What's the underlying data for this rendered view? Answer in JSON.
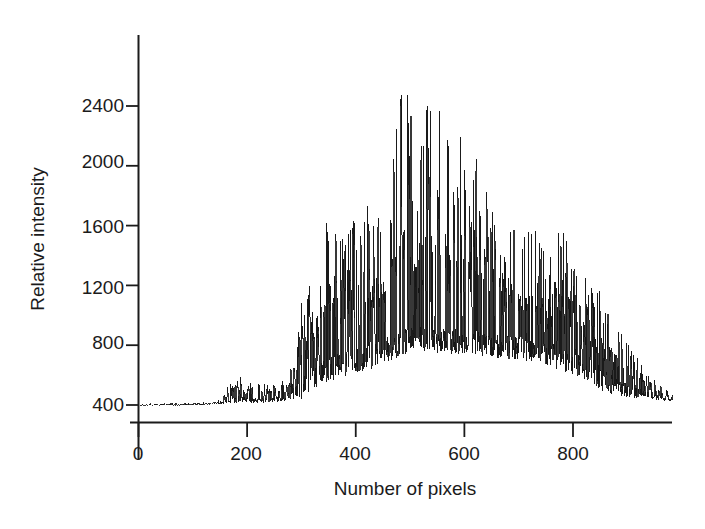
{
  "figure": {
    "background_color": "#ffffff",
    "trace_color": "#151515",
    "axis_color": "#1b1b1b"
  },
  "axes": {
    "x_title": "Number of pixels",
    "y_title": "Relative intensity",
    "x_ticks": [
      "0",
      "200",
      "400",
      "600",
      "800"
    ],
    "y_ticks": [
      "400",
      "800",
      "1200",
      "1600",
      "2000",
      "2400"
    ]
  },
  "chart_data": {
    "type": "line",
    "title": "",
    "subtitle": "",
    "xlabel": "Number of pixels",
    "ylabel": "Relative intensity",
    "xlim": [
      0,
      985
    ],
    "ylim": [
      330,
      2750
    ],
    "xticks": [
      0,
      200,
      400,
      600,
      800
    ],
    "yticks": [
      400,
      800,
      1200,
      1600,
      2000,
      2400
    ],
    "grid": false,
    "legend": null,
    "annotations": [],
    "series": [
      {
        "name": "intensity",
        "envelope_profile": {
          "x": [
            0,
            60,
            120,
            150,
            170,
            185,
            200,
            230,
            250,
            270,
            285,
            300,
            315,
            330,
            350,
            370,
            390,
            410,
            430,
            450,
            470,
            490,
            510,
            530,
            550,
            570,
            590,
            610,
            630,
            650,
            670,
            690,
            710,
            730,
            750,
            770,
            790,
            810,
            830,
            850,
            870,
            890,
            910,
            930,
            950,
            970,
            985
          ],
          "baseline": [
            398,
            400,
            404,
            412,
            430,
            440,
            432,
            430,
            436,
            450,
            470,
            520,
            560,
            600,
            640,
            660,
            680,
            700,
            720,
            760,
            790,
            820,
            840,
            840,
            830,
            830,
            820,
            820,
            810,
            800,
            790,
            780,
            770,
            760,
            740,
            720,
            700,
            660,
            620,
            580,
            540,
            510,
            490,
            470,
            455,
            440,
            432
          ],
          "peak": [
            408,
            412,
            418,
            440,
            560,
            620,
            560,
            540,
            560,
            600,
            660,
            1100,
            1280,
            1420,
            1700,
            1560,
            1620,
            1800,
            1680,
            1760,
            2140,
            2700,
            2200,
            2480,
            2560,
            2180,
            2420,
            2330,
            1960,
            1800,
            1740,
            1640,
            1560,
            1620,
            1540,
            1640,
            1500,
            1320,
            1220,
            1180,
            1000,
            880,
            760,
            660,
            580,
            520,
            470
          ]
        },
        "max_value": 2700,
        "min_value": 395
      }
    ]
  }
}
